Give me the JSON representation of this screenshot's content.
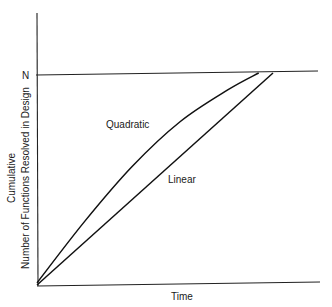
{
  "chart_data": {
    "type": "line",
    "title": "",
    "xlabel": "Time",
    "ylabel_line1": "Cumulative",
    "ylabel_line2": "Number of Functions Resolved in Design",
    "ytick_label": "N",
    "xlim": [
      0,
      1
    ],
    "ylim": [
      0,
      1.2
    ],
    "ceiling": 1.0,
    "series": [
      {
        "name": "Quadratic",
        "label": "Quadratic",
        "x": [
          0,
          0.2,
          0.4,
          0.6,
          0.8,
          0.93
        ],
        "y": [
          0.01,
          0.3,
          0.56,
          0.77,
          0.92,
          1.0
        ]
      },
      {
        "name": "Linear",
        "label": "Linear",
        "x": [
          0,
          0.99
        ],
        "y": [
          0,
          1.0
        ]
      }
    ]
  }
}
